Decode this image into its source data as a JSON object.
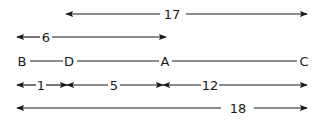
{
  "diagram": {
    "type": "line-segment-measurements",
    "points": [
      {
        "name": "B",
        "label": "B"
      },
      {
        "name": "D",
        "label": "D"
      },
      {
        "name": "A",
        "label": "A"
      },
      {
        "name": "C",
        "label": "C"
      }
    ],
    "measurements": {
      "DC": {
        "label": "17",
        "from": "D",
        "to": "C"
      },
      "BA": {
        "label": "6",
        "from": "B",
        "to": "A"
      },
      "BD": {
        "label": "1",
        "from": "B",
        "to": "D"
      },
      "DA": {
        "label": "5",
        "from": "D",
        "to": "A"
      },
      "AC": {
        "label": "12",
        "from": "A",
        "to": "C"
      },
      "BC": {
        "label": "18",
        "from": "B",
        "to": "C"
      }
    },
    "colors": {
      "ink": "#1a1a1a",
      "background": "#ffffff"
    }
  }
}
